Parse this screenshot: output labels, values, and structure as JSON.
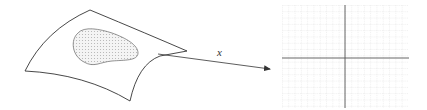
{
  "diagram": {
    "surface": {
      "label": "",
      "stroke": "#333333",
      "region_fill": "#cfcfcf"
    },
    "map": {
      "label": "x",
      "stroke": "#333333"
    },
    "plane": {
      "grid_color": "#c8c8c8",
      "axis_color": "#555555",
      "x_range": [
        282,
        408
      ],
      "y_range": [
        5,
        108
      ],
      "axis_x": 345,
      "axis_y": 58,
      "spacing": 6.3
    }
  }
}
